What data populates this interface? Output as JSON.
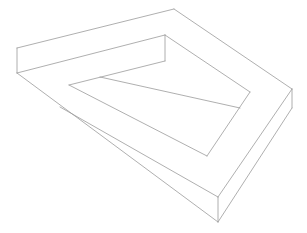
{
  "figure": {
    "title": "",
    "stroke_color": "#9a9a9a",
    "background": "#ffffff",
    "segments": [
      {
        "name": "outer-top-edge",
        "x1": 17,
        "y1": 48,
        "x2": 174,
        "y2": 9
      },
      {
        "name": "outer-left-vertical",
        "x1": 17,
        "y1": 48,
        "x2": 17,
        "y2": 73
      },
      {
        "name": "front-top-edge",
        "x1": 17,
        "y1": 73,
        "x2": 165,
        "y2": 35
      },
      {
        "name": "inner-corner-vertical",
        "x1": 165,
        "y1": 35,
        "x2": 165,
        "y2": 61
      },
      {
        "name": "outer-right-edge",
        "x1": 174,
        "y1": 9,
        "x2": 292,
        "y2": 89
      },
      {
        "name": "right-vertical",
        "x1": 292,
        "y1": 89,
        "x2": 292,
        "y2": 108
      },
      {
        "name": "outer-bottom-left-edge",
        "x1": 17,
        "y1": 73,
        "x2": 218,
        "y2": 222
      },
      {
        "name": "bottom-vertical",
        "x1": 218,
        "y1": 197,
        "x2": 218,
        "y2": 222
      },
      {
        "name": "right-bottom-top-edge",
        "x1": 218,
        "y1": 197,
        "x2": 292,
        "y2": 89
      },
      {
        "name": "right-bottom-lower-edge",
        "x1": 218,
        "y1": 222,
        "x2": 292,
        "y2": 108
      },
      {
        "name": "inner-right-top-edge",
        "x1": 165,
        "y1": 35,
        "x2": 250,
        "y2": 92
      },
      {
        "name": "inner-back-edge",
        "x1": 165,
        "y1": 61,
        "x2": 69,
        "y2": 85
      },
      {
        "name": "inner-left-edge",
        "x1": 69,
        "y1": 85,
        "x2": 207,
        "y2": 156
      },
      {
        "name": "inner-right-edge",
        "x1": 250,
        "y1": 92,
        "x2": 207,
        "y2": 156
      },
      {
        "name": "inner-divider",
        "x1": 100,
        "y1": 77,
        "x2": 240,
        "y2": 108
      },
      {
        "name": "inner-band-edge",
        "x1": 60,
        "y1": 107,
        "x2": 218,
        "y2": 197
      }
    ]
  }
}
